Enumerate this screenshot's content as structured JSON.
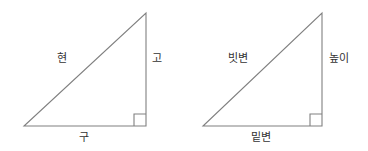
{
  "figure": {
    "background_color": "#ffffff",
    "line_color": "#808080",
    "text_color": "#333333"
  },
  "triangles": [
    {
      "id": "classical",
      "name": "classical-terms-triangle",
      "vertices": {
        "bottom_left": [
          24,
          126
        ],
        "bottom_right": [
          146,
          126
        ],
        "apex": [
          146,
          13
        ]
      },
      "right_angle_at": "bottom_right",
      "right_angle_marker_size": 12,
      "labels": {
        "hypotenuse": "현",
        "vertical": "고",
        "base": "구"
      }
    },
    {
      "id": "modern",
      "name": "modern-terms-triangle",
      "vertices": {
        "bottom_left": [
          203,
          126
        ],
        "bottom_right": [
          322,
          126
        ],
        "apex": [
          322,
          13
        ]
      },
      "right_angle_at": "bottom_right",
      "right_angle_marker_size": 12,
      "labels": {
        "hypotenuse": "빗변",
        "vertical": "높이",
        "base": "밑변"
      }
    }
  ]
}
